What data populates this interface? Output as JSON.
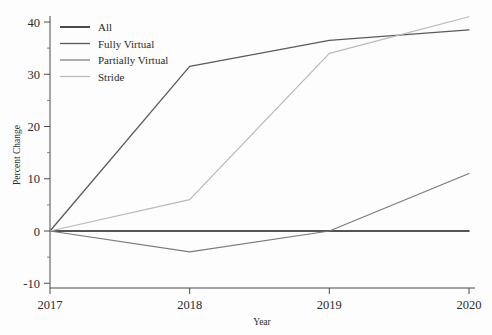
{
  "chart_data": {
    "type": "line",
    "title": "",
    "xlabel": "Year",
    "ylabel": "Percent Change",
    "x": [
      2017,
      2018,
      2019,
      2020
    ],
    "xtick_labels": [
      "2017",
      "2018",
      "2019",
      "2020"
    ],
    "ytick_labels": [
      "-10",
      "0",
      "10",
      "20",
      "30",
      "40"
    ],
    "yticks": [
      -10,
      0,
      10,
      20,
      30,
      40
    ],
    "xlim": [
      2017,
      2020
    ],
    "ylim": [
      -13,
      43
    ],
    "grid": false,
    "legend_position": "top-left",
    "series": [
      {
        "name": "All",
        "values": [
          0,
          0,
          0,
          0
        ],
        "color": "#1c1c1c",
        "width": 1.6
      },
      {
        "name": "Fully Virtual",
        "values": [
          0,
          31.5,
          36.5,
          38.5
        ],
        "color": "#5a5a5a",
        "width": 1.3
      },
      {
        "name": "Partially Virtual",
        "values": [
          0,
          -4,
          0,
          11
        ],
        "color": "#7a7a7a",
        "width": 1.2
      },
      {
        "name": "Stride",
        "values": [
          0,
          6,
          34,
          41
        ],
        "color": "#b8b8b8",
        "width": 1.2
      }
    ]
  },
  "axes": {
    "y_axis_title": "Percent Change",
    "x_axis_title": "Year"
  },
  "legend": {
    "entries": [
      {
        "label": "All"
      },
      {
        "label": "Fully Virtual"
      },
      {
        "label": "Partially Virtual"
      },
      {
        "label": "Stride"
      }
    ]
  }
}
